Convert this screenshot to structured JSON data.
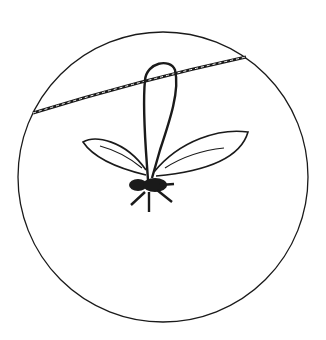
{
  "illustration": {
    "subject": "insect hanging by a thread loop from a wire, shown within a circular inset",
    "stroke_color": "#1a1a1a",
    "background": "#ffffff"
  }
}
